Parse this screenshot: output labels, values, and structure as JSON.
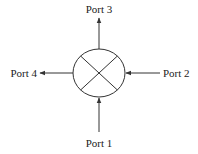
{
  "diagram": {
    "type": "four-port coupler / circulator symbol",
    "colors": {
      "stroke": "#333333",
      "text": "#222222",
      "background": "#ffffff"
    },
    "ports": [
      {
        "id": "port1",
        "label": "Port 1",
        "position": "bottom",
        "arrow_direction": "into-circle"
      },
      {
        "id": "port2",
        "label": "Port 2",
        "position": "right",
        "arrow_direction": "into-circle"
      },
      {
        "id": "port3",
        "label": "Port 3",
        "position": "top",
        "arrow_direction": "out-of-circle"
      },
      {
        "id": "port4",
        "label": "Port 4",
        "position": "left",
        "arrow_direction": "out-of-circle"
      }
    ],
    "center_symbol": "circle-with-x"
  }
}
